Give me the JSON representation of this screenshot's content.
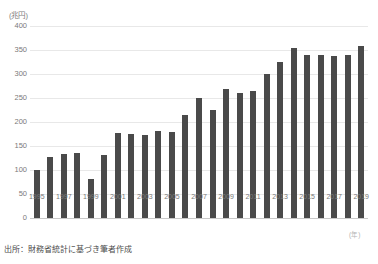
{
  "chart_data": {
    "type": "bar",
    "title": "",
    "xlabel": "(年)",
    "ylabel": "(兆円)",
    "ylim": [
      0,
      400
    ],
    "yticks": [
      0,
      50,
      100,
      150,
      200,
      250,
      300,
      350,
      400
    ],
    "ytick_labels": [
      "0",
      "50",
      "100",
      "150",
      "200",
      "250",
      "300",
      "350",
      "400"
    ],
    "grid": true,
    "legend": "none",
    "bar_color": "#4a4a4a",
    "categories": [
      "1995",
      "1996",
      "1997",
      "1998",
      "1999",
      "2000",
      "2001",
      "2002",
      "2003",
      "2004",
      "2005",
      "2006",
      "2007",
      "2008",
      "2009",
      "2010",
      "2011",
      "2012",
      "2013",
      "2014",
      "2015",
      "2016",
      "2017",
      "2018",
      "2019"
    ],
    "xtick_labels": [
      "1995",
      "1997",
      "1999",
      "2001",
      "2003",
      "2005",
      "2007",
      "2009",
      "2011",
      "2013",
      "2015",
      "2017",
      "2019"
    ],
    "values": [
      100,
      127,
      134,
      135,
      81,
      132,
      178,
      175,
      172,
      182,
      180,
      214,
      250,
      225,
      268,
      260,
      265,
      300,
      325,
      355,
      340,
      339,
      337,
      340,
      358
    ]
  },
  "annotations": {
    "y_unit_label": "(兆円)",
    "x_unit_label": "(年)",
    "source_note": "出所：財務省統計に基づき筆者作成",
    "top_title_fragment": ""
  }
}
